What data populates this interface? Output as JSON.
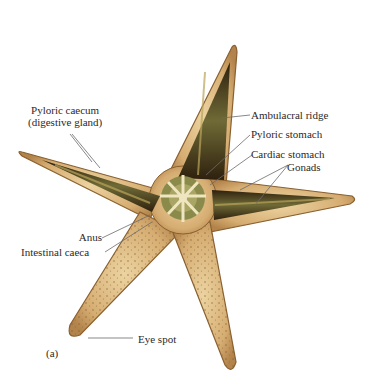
{
  "figure": {
    "panel_label": "(a)",
    "colors": {
      "skin": "#d9b27a",
      "skin_dark": "#b88a4e",
      "interior_dark": "#3b2a14",
      "gland_green": "#8a8a4a",
      "disk_pale": "#e8dcb0",
      "leader_line": "#6b6b6b",
      "text": "#2a2a2a"
    }
  },
  "labels": {
    "pyloric_caecum_1": "Pyloric caecum",
    "pyloric_caecum_2": "(digestive gland)",
    "ambulacral_ridge": "Ambulacral ridge",
    "pyloric_stomach": "Pyloric stomach",
    "cardiac_stomach": "Cardiac stomach",
    "gonads": "Gonads",
    "anus": "Anus",
    "intestinal_caeca": "Intestinal caeca",
    "eye_spot": "Eye spot"
  }
}
